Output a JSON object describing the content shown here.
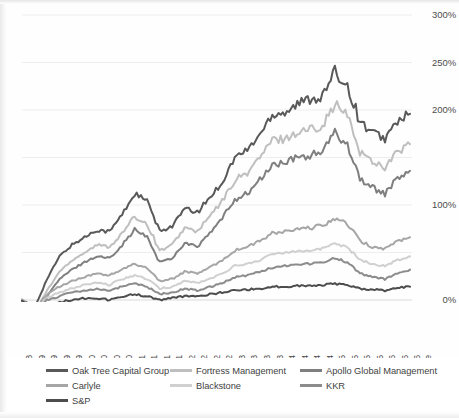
{
  "chart_data": {
    "type": "line",
    "title": "",
    "xlabel": "Date",
    "ylabel": "",
    "ylim": [
      0,
      300
    ],
    "yticks": [
      0,
      100,
      200,
      250,
      300
    ],
    "ytick_labels": [
      "0%",
      "100%",
      "200%",
      "250%",
      "300%"
    ],
    "grid": true,
    "legend_position": "bottom",
    "x": [
      "12/1/2008",
      "3/2/2009",
      "6/1/2009",
      "9/1/2009",
      "12/1/2009",
      "3/1/2010",
      "6/1/2010",
      "9/1/2010",
      "12/1/2010",
      "3/1/2011",
      "6/1/2011",
      "9/1/2011",
      "12/1/2011",
      "3/1/2012",
      "6/1/2012",
      "9/4/2012",
      "12/3/2012",
      "3/1/2013",
      "6/3/2013",
      "9/3/2013",
      "12/2/2013",
      "3/3/2014",
      "6/2/2014",
      "9/2/2014",
      "12/1/2014",
      "3/2/2015",
      "6/1/2015",
      "9/1/2015",
      "12/1/2015",
      "3/1/2016",
      "6/1/2016",
      "9/1/2016"
    ],
    "series": [
      {
        "name": "Oak Tree Capital Group",
        "color": "#595959",
        "width": 2.0,
        "values": [
          0,
          -8,
          22,
          46,
          58,
          66,
          74,
          72,
          90,
          112,
          104,
          72,
          78,
          96,
          92,
          108,
          124,
          150,
          158,
          174,
          196,
          198,
          206,
          212,
          214,
          240,
          226,
          188,
          176,
          170,
          188,
          196
        ]
      },
      {
        "name": "Fortress Management",
        "color": "#bfbfbf",
        "width": 2.0,
        "values": [
          0,
          -14,
          10,
          30,
          42,
          50,
          58,
          56,
          70,
          88,
          80,
          52,
          58,
          76,
          72,
          88,
          104,
          126,
          134,
          150,
          168,
          170,
          176,
          180,
          184,
          206,
          194,
          156,
          146,
          140,
          156,
          164
        ]
      },
      {
        "name": "Apollo Global Management",
        "color": "#7f7f7f",
        "width": 2.0,
        "values": [
          0,
          -18,
          4,
          22,
          32,
          40,
          46,
          44,
          58,
          74,
          66,
          40,
          44,
          60,
          56,
          70,
          86,
          106,
          112,
          126,
          142,
          144,
          150,
          152,
          156,
          176,
          164,
          128,
          118,
          112,
          128,
          136
        ]
      },
      {
        "name": "Carlyle",
        "color": "#a6a6a6",
        "width": 2.0,
        "values": [
          0,
          -10,
          6,
          14,
          20,
          24,
          28,
          26,
          32,
          38,
          34,
          20,
          22,
          30,
          28,
          34,
          42,
          52,
          56,
          62,
          70,
          72,
          74,
          76,
          78,
          86,
          80,
          62,
          56,
          54,
          62,
          66
        ]
      },
      {
        "name": "Blackstone",
        "color": "#d0d0d0",
        "width": 2.0,
        "values": [
          0,
          -12,
          2,
          8,
          12,
          16,
          18,
          16,
          22,
          26,
          22,
          12,
          14,
          20,
          18,
          22,
          28,
          36,
          38,
          42,
          48,
          50,
          52,
          52,
          54,
          60,
          56,
          42,
          38,
          36,
          42,
          46
        ]
      },
      {
        "name": "KKR",
        "color": "#8c8c8c",
        "width": 2.0,
        "values": [
          0,
          -14,
          0,
          4,
          8,
          10,
          12,
          10,
          14,
          18,
          14,
          6,
          8,
          12,
          10,
          14,
          18,
          24,
          26,
          30,
          34,
          36,
          38,
          38,
          40,
          44,
          40,
          28,
          24,
          22,
          28,
          32
        ]
      },
      {
        "name": "S&P",
        "color": "#4d4d4d",
        "width": 2.0,
        "values": [
          0,
          -16,
          -6,
          -2,
          0,
          2,
          2,
          0,
          4,
          6,
          4,
          0,
          2,
          4,
          4,
          6,
          8,
          10,
          11,
          12,
          14,
          14,
          15,
          15,
          16,
          17,
          16,
          12,
          11,
          10,
          13,
          14
        ]
      }
    ]
  },
  "axes": {
    "x_axis_title": "Date"
  },
  "legend": {
    "items": [
      {
        "label": "Oak Tree Capital Group",
        "color": "#595959"
      },
      {
        "label": "Fortress Management",
        "color": "#bfbfbf"
      },
      {
        "label": "Apollo Global Management",
        "color": "#7f7f7f"
      },
      {
        "label": "Carlyle",
        "color": "#a6a6a6"
      },
      {
        "label": "Blackstone",
        "color": "#d0d0d0"
      },
      {
        "label": "KKR",
        "color": "#8c8c8c"
      },
      {
        "label": "S&P",
        "color": "#4d4d4d"
      }
    ]
  }
}
